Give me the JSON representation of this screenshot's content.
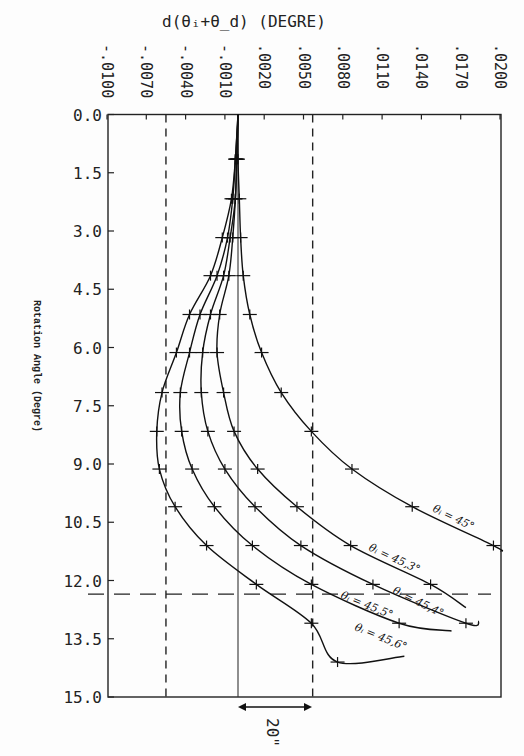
{
  "chart_data": {
    "type": "line",
    "title": "",
    "xlabel": "d(θi+θd) (DEGRE)",
    "ylabel": "Rotation Angle (Degre)",
    "orientation": "x axis on top, y axis increasing downward",
    "x_ticks": [
      "-.0100",
      "-.0070",
      "-.0040",
      "-.0010",
      ".0020",
      ".0050",
      ".0080",
      ".0110",
      ".0140",
      ".0170",
      ".0200"
    ],
    "x_tick_values": [
      -0.01,
      -0.007,
      -0.004,
      -0.001,
      0.002,
      0.005,
      0.008,
      0.011,
      0.014,
      0.017,
      0.02
    ],
    "y_ticks": [
      "0.0",
      "1.5",
      "3.0",
      "4.5",
      "6.0",
      "7.5",
      "9.0",
      "10.5",
      "12.0",
      "13.5",
      "15.0"
    ],
    "xlim": [
      -0.01,
      0.02
    ],
    "ylim": [
      0.0,
      15.0
    ],
    "grid": false,
    "reference_lines": {
      "vertical_solid_x": 0.0,
      "vertical_dashed_x": [
        -0.0055,
        0.0057
      ],
      "horizontal_dashed_y": 12.35
    },
    "annotation": {
      "text": "20\"",
      "span_x": [
        0.0,
        0.0057
      ],
      "type": "double-arrow"
    },
    "series": [
      {
        "name": "θi = 45°",
        "y": [
          1.15,
          2.17,
          3.17,
          4.15,
          5.15,
          6.13,
          7.16,
          8.16,
          9.13,
          10.1,
          11.1
        ],
        "x": [
          0.0,
          0.0001,
          0.0002,
          0.0004,
          0.0009,
          0.0018,
          0.0033,
          0.0056,
          0.0087,
          0.0133,
          0.0195
        ]
      },
      {
        "name": "θi = 45.3°",
        "y": [
          1.15,
          2.17,
          3.17,
          4.15,
          5.15,
          6.13,
          7.16,
          8.16,
          9.13,
          10.1,
          11.1,
          12.1
        ],
        "x": [
          -0.0001,
          -0.0002,
          -0.0004,
          -0.0007,
          -0.0014,
          -0.0016,
          -0.0011,
          -0.0003,
          0.0015,
          0.0045,
          0.0086,
          0.0147
        ]
      },
      {
        "name": "θi = 45.4°",
        "y": [
          1.15,
          2.17,
          3.17,
          4.15,
          5.15,
          6.13,
          7.16,
          8.16,
          9.13,
          10.1,
          11.1,
          12.1,
          13.1
        ],
        "x": [
          -0.0001,
          -0.0002,
          -0.0006,
          -0.0011,
          -0.0021,
          -0.0027,
          -0.0028,
          -0.0023,
          -0.001,
          0.0013,
          0.0048,
          0.0103,
          0.0174
        ]
      },
      {
        "name": "θi = 45.5°",
        "y": [
          1.15,
          2.17,
          3.17,
          4.15,
          5.15,
          6.13,
          7.16,
          8.16,
          9.13,
          10.1,
          11.1,
          12.1,
          13.1
        ],
        "x": [
          -0.0002,
          -0.0004,
          -0.0008,
          -0.0016,
          -0.0029,
          -0.0037,
          -0.0044,
          -0.0043,
          -0.0035,
          -0.0018,
          0.0011,
          0.0056,
          0.0123
        ]
      },
      {
        "name": "θi = 45.6°",
        "y": [
          1.15,
          2.17,
          3.17,
          4.15,
          5.15,
          6.13,
          7.16,
          8.16,
          9.13,
          10.1,
          11.1,
          12.1,
          13.1,
          14.1
        ],
        "x": [
          -0.0002,
          -0.0005,
          -0.0012,
          -0.0021,
          -0.0037,
          -0.0047,
          -0.0058,
          -0.0062,
          -0.006,
          -0.0048,
          -0.0024,
          0.0014,
          0.0056,
          0.0076
        ]
      }
    ]
  },
  "labels": {
    "x_axis_title": "d(θᵢ+θ_d)  (DEGRE)",
    "y_axis_title": "Rotation Angle (Degre)",
    "annotation": "20\"",
    "curves": [
      "θᵢ = 45°",
      "θᵢ = 45,3°",
      "θᵢ = 45,4°",
      "θᵢ = 45,5°",
      "θᵢ = 45,6°"
    ]
  }
}
